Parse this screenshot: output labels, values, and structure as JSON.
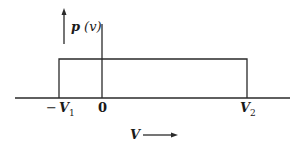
{
  "diagram": {
    "type": "uniform-probability-density",
    "y_label": {
      "main": "p",
      "arg": "(v)"
    },
    "x_label": "V",
    "ticks": [
      {
        "id": "neg-v1",
        "sign": "−",
        "sym": "V",
        "sub": "1"
      },
      {
        "id": "zero",
        "text": "0"
      },
      {
        "id": "v2",
        "sym": "V",
        "sub": "2"
      }
    ],
    "distribution": {
      "lower": "-V1",
      "upper": "V2",
      "shape": "rectangle"
    },
    "stroke_color": "#2a2a2a"
  }
}
